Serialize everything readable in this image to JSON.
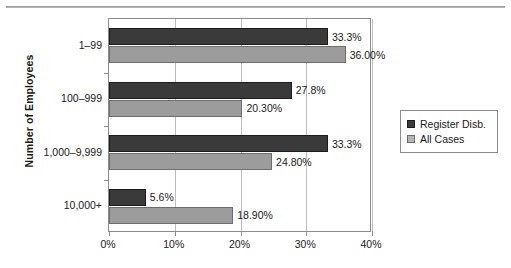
{
  "chart_data": {
    "type": "bar",
    "orientation": "horizontal",
    "title": "",
    "xlabel": "",
    "ylabel": "Number of Employees",
    "xlim": [
      0,
      40
    ],
    "xticks": [
      0,
      10,
      20,
      30,
      40
    ],
    "xtick_labels": [
      "0%",
      "10%",
      "20%",
      "30%",
      "40%"
    ],
    "grid": true,
    "grid_axis": "x",
    "legend_position": "right",
    "categories": [
      "1–99",
      "100–999",
      "1,000–9,999",
      "10,000+"
    ],
    "series": [
      {
        "name": "Register Disb.",
        "color": "#3a3a3a",
        "values": [
          33.3,
          27.8,
          33.3,
          5.6
        ],
        "labels": [
          "33.3%",
          "27.8%",
          "33.3%",
          "5.6%"
        ]
      },
      {
        "name": "All Cases",
        "color": "#9c9c9c",
        "values": [
          36.0,
          20.3,
          24.8,
          18.9
        ],
        "labels": [
          "36.00%",
          "20.30%",
          "24.80%",
          "18.90%"
        ]
      }
    ]
  },
  "legend": {
    "items": [
      {
        "label": "Register Disb.",
        "swatch": "dark-square-swatch"
      },
      {
        "label": "All Cases",
        "swatch": "light-square-swatch"
      }
    ]
  }
}
